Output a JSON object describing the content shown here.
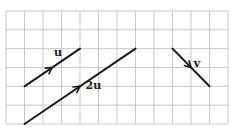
{
  "figure": {
    "grid": {
      "columns": 12,
      "rows": 6,
      "origin_px": [
        6,
        11
      ],
      "cell_w": 18.5,
      "cell_h": 18.83,
      "line_color": "#c8c8c8"
    },
    "vectors": [
      {
        "id": "u",
        "label": "u",
        "from": [
          1,
          4
        ],
        "to": [
          4,
          2
        ],
        "arrow_at": 0.5,
        "label_pos": [
          2.6,
          2.4
        ]
      },
      {
        "id": "2u",
        "label": "2u",
        "from": [
          1,
          6
        ],
        "to": [
          7,
          2
        ],
        "arrow_at": 0.5,
        "label_pos": [
          4.3,
          4.15
        ]
      },
      {
        "id": "v",
        "label": "v",
        "from": [
          9,
          2
        ],
        "to": [
          11,
          4
        ],
        "arrow_at": 0.5,
        "label_pos": [
          10.15,
          2.95
        ]
      }
    ],
    "stroke_color": "#1a1a1a"
  }
}
